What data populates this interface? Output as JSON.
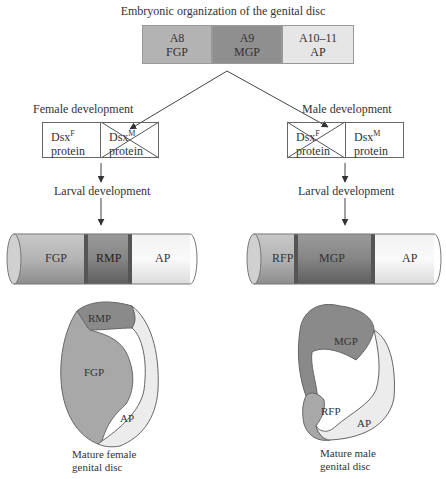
{
  "title": "Embryonic organization of the genital disc",
  "embryonic_segments": [
    {
      "segment": "A8",
      "primordium": "FGP",
      "color": "#b3b3b3"
    },
    {
      "segment": "A9",
      "primordium": "MGP",
      "color": "#8f8f8f"
    },
    {
      "segment": "A10–11",
      "primordium": "AP",
      "color": "#e6e6e6"
    }
  ],
  "female": {
    "heading": "Female development",
    "proteins": [
      {
        "name": "Dsx",
        "sup": "F",
        "label": "protein",
        "crossed": false
      },
      {
        "name": "Dsx",
        "sup": "M",
        "label": "protein",
        "crossed": true
      }
    ],
    "larval_label": "Larval development",
    "cylinder": [
      "FGP",
      "RMP",
      "AP"
    ],
    "disc": {
      "regions": [
        "RMP",
        "FGP",
        "AP"
      ],
      "caption_line1": "Mature female",
      "caption_line2": "genital disc"
    }
  },
  "male": {
    "heading": "Male development",
    "proteins": [
      {
        "name": "Dsx",
        "sup": "F",
        "label": "protein",
        "crossed": true
      },
      {
        "name": "Dsx",
        "sup": "M",
        "label": "protein",
        "crossed": false
      }
    ],
    "larval_label": "Larval development",
    "cylinder": [
      "RFP",
      "MGP",
      "AP"
    ],
    "disc": {
      "regions": [
        "MGP",
        "RFP",
        "AP"
      ],
      "caption_line1": "Mature male",
      "caption_line2": "genital disc"
    }
  }
}
